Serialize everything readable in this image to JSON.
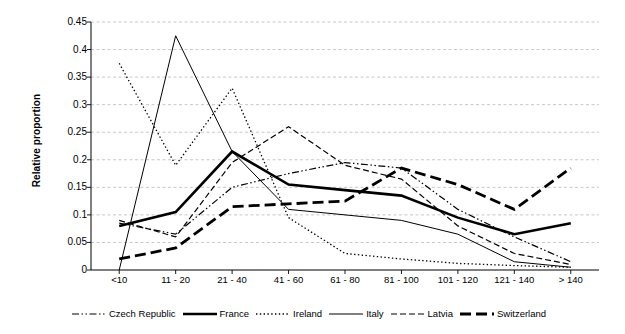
{
  "chart_data": {
    "type": "line",
    "title": "",
    "xlabel": "",
    "ylabel": "Relative proportion",
    "categories": [
      "<10",
      "11 - 20",
      "21 - 40",
      "41 - 60",
      "61 - 80",
      "81 - 100",
      "101 - 120",
      "121 - 140",
      "> 140"
    ],
    "ylim": [
      0,
      0.45
    ],
    "ytick_labels": [
      "0",
      "0.05",
      "0.1",
      "0.15",
      "0.2",
      "0.25",
      "0.3",
      "0.35",
      "0.4",
      "0.45"
    ],
    "ytick_values": [
      0,
      0.05,
      0.1,
      0.15,
      0.2,
      0.25,
      0.3,
      0.35,
      0.4,
      0.45
    ],
    "grid": true,
    "grid_axis": "y",
    "legend_position": "bottom",
    "series": [
      {
        "name": "Czech Republic",
        "style": "dash-dot",
        "color": "#000000",
        "width": 1.2,
        "dasharray": "7,2.5,1.5,2.5,1.5,2.5",
        "values": [
          0.085,
          0.065,
          0.15,
          0.175,
          0.195,
          0.185,
          0.11,
          0.06,
          0.015
        ]
      },
      {
        "name": "France",
        "style": "solid-thick",
        "color": "#000000",
        "width": 2.6,
        "dasharray": "",
        "values": [
          0.08,
          0.105,
          0.215,
          0.155,
          0.145,
          0.135,
          0.095,
          0.065,
          0.085
        ]
      },
      {
        "name": "Ireland",
        "style": "dotted",
        "color": "#000000",
        "width": 1.3,
        "dasharray": "1.4,2.4",
        "values": [
          0.375,
          0.19,
          0.33,
          0.095,
          0.03,
          0.02,
          0.012,
          0.008,
          0.005
        ]
      },
      {
        "name": "Italy",
        "style": "solid-thin",
        "color": "#000000",
        "width": 1.0,
        "dasharray": "",
        "values": [
          0.0,
          0.425,
          0.215,
          0.11,
          0.1,
          0.09,
          0.065,
          0.015,
          0.005
        ]
      },
      {
        "name": "Latvia",
        "style": "dashed",
        "color": "#000000",
        "width": 1.2,
        "dasharray": "6,3",
        "values": [
          0.09,
          0.06,
          0.195,
          0.26,
          0.19,
          0.165,
          0.08,
          0.03,
          0.01
        ]
      },
      {
        "name": "Switzerland",
        "style": "dashed-thick",
        "color": "#000000",
        "width": 2.8,
        "dasharray": "11,5",
        "values": [
          0.02,
          0.04,
          0.115,
          0.12,
          0.125,
          0.185,
          0.155,
          0.11,
          0.185
        ]
      }
    ]
  }
}
